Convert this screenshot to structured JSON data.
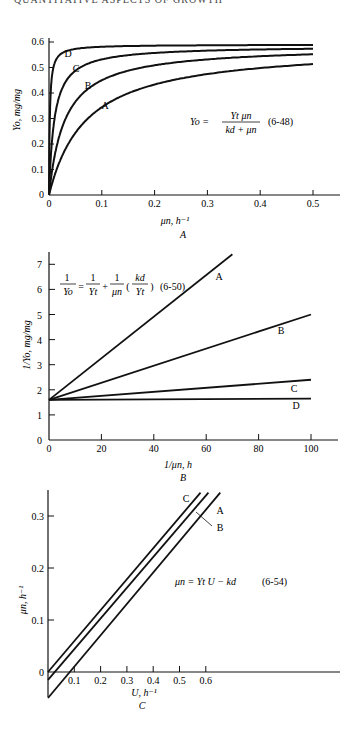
{
  "header": {
    "text": "QUANTITATIVE ASPECTS OF GROWTH"
  },
  "chart_data": [
    {
      "panel": "A",
      "type": "line",
      "title": "",
      "xlabel": "μn, h⁻¹",
      "ylabel": "Yo, mg/mg",
      "xlim": [
        0,
        0.55
      ],
      "ylim": [
        0,
        0.6
      ],
      "xticks": [
        "0",
        "0.1",
        "0.2",
        "0.3",
        "0.4",
        "0.5"
      ],
      "yticks": [
        "0",
        "0.1",
        "0.2",
        "0.3",
        "0.4",
        "0.5",
        "0.6"
      ],
      "equation": "Yo = Yt μn / (kd + μn)",
      "equation_number": "(6-48)",
      "series": [
        {
          "name": "A",
          "Yt": 0.6,
          "kd": 0.07,
          "x": [
            0,
            0.05,
            0.1,
            0.2,
            0.3,
            0.4,
            0.5
          ],
          "values": [
            0,
            0.25,
            0.35,
            0.44,
            0.48,
            0.51,
            0.53
          ]
        },
        {
          "name": "B",
          "Yt": 0.6,
          "kd": 0.03,
          "x": [
            0,
            0.05,
            0.1,
            0.2,
            0.3,
            0.4,
            0.5
          ],
          "values": [
            0,
            0.37,
            0.46,
            0.52,
            0.545,
            0.555,
            0.565
          ]
        },
        {
          "name": "C",
          "Yt": 0.6,
          "kd": 0.01,
          "x": [
            0,
            0.05,
            0.1,
            0.2,
            0.3,
            0.4,
            0.5
          ],
          "values": [
            0,
            0.5,
            0.545,
            0.57,
            0.58,
            0.585,
            0.585
          ]
        },
        {
          "name": "D",
          "Yt": 0.6,
          "kd": 0.0,
          "x": [
            0,
            0.01,
            0.05,
            0.1,
            0.5
          ],
          "values": [
            0,
            0.55,
            0.59,
            0.59,
            0.59
          ]
        }
      ],
      "panel_label": "A"
    },
    {
      "panel": "B",
      "type": "line",
      "xlabel": "1/μn, h",
      "ylabel": "1/Yo, mg/mg",
      "xlim": [
        0,
        110
      ],
      "ylim": [
        0,
        7.5
      ],
      "xticks": [
        "0",
        "20",
        "40",
        "60",
        "80",
        "100"
      ],
      "yticks": [
        "0",
        "1",
        "2",
        "3",
        "4",
        "5",
        "6",
        "7"
      ],
      "equation": "1/Yo = 1/Yt + (1/μn)(kd/Yt)",
      "equation_number": "(6-50)",
      "series": [
        {
          "name": "A",
          "x": [
            0,
            70
          ],
          "values": [
            1.6,
            7.4
          ]
        },
        {
          "name": "B",
          "x": [
            0,
            100
          ],
          "values": [
            1.6,
            5.0
          ]
        },
        {
          "name": "C",
          "x": [
            0,
            100
          ],
          "values": [
            1.6,
            2.4
          ]
        },
        {
          "name": "D",
          "x": [
            0,
            100
          ],
          "values": [
            1.6,
            1.65
          ]
        }
      ],
      "panel_label": "B"
    },
    {
      "panel": "C",
      "type": "line",
      "xlabel": "U, h⁻¹",
      "ylabel": "μn, h⁻¹",
      "xlim": [
        0,
        0.65
      ],
      "ylim": [
        -0.05,
        0.35
      ],
      "xticks": [
        "0",
        "0.1",
        "0.2",
        "0.3",
        "0.4",
        "0.5",
        "0.6"
      ],
      "yticks": [
        "0",
        "0.1",
        "0.2",
        "0.3"
      ],
      "equation": "μn = Yt U − kd",
      "equation_number": "(6-54)",
      "series": [
        {
          "name": "C",
          "x": [
            0,
            0.58
          ],
          "values": [
            0.0,
            0.345
          ]
        },
        {
          "name": "B",
          "x": [
            0,
            0.61
          ],
          "values": [
            -0.015,
            0.345
          ]
        },
        {
          "name": "A",
          "x": [
            0,
            0.655
          ],
          "values": [
            -0.05,
            0.345
          ]
        }
      ],
      "panel_label": "C"
    }
  ]
}
